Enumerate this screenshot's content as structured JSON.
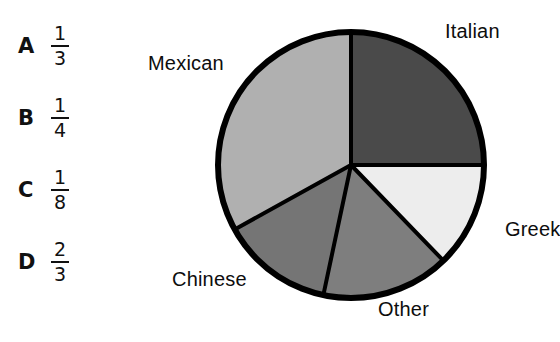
{
  "figure": {
    "name": "favorite-cuisine-pie-chart",
    "background": "#ffffff"
  },
  "answer_choices": [
    {
      "letter": "A",
      "numerator": "1",
      "denominator": "3"
    },
    {
      "letter": "B",
      "numerator": "1",
      "denominator": "4"
    },
    {
      "letter": "C",
      "numerator": "1",
      "denominator": "8"
    },
    {
      "letter": "D",
      "numerator": "2",
      "denominator": "3"
    }
  ],
  "labels": {
    "mexican": "Mexican",
    "italian": "Italian",
    "greek": "Greek",
    "other": "Other",
    "chinese": "Chinese"
  },
  "chart_data": {
    "type": "pie",
    "title": "",
    "xlabel": "",
    "ylabel": "",
    "legend_position": "outside-labels",
    "grid": false,
    "start_angle_deg": 0,
    "direction": "clockwise",
    "center": {
      "cx": 151,
      "cy": 165,
      "r": 133
    },
    "outline_color": "#000000",
    "outline_width": 6,
    "separator_color": "#000000",
    "separator_width": 4,
    "categories": [
      "Italian",
      "Greek",
      "Other",
      "Chinese",
      "Mexican"
    ],
    "values": [
      25,
      12.8,
      15.6,
      13.6,
      33
    ],
    "units": "percent",
    "slices": [
      {
        "label": "Italian",
        "start_deg": 0,
        "end_deg": 90,
        "sweep_deg": 90,
        "fraction": "1/4",
        "percent": 25,
        "color": "#4a4a4a"
      },
      {
        "label": "Greek",
        "start_deg": 90,
        "end_deg": 136,
        "sweep_deg": 46,
        "fraction": "1/8",
        "percent": 12.8,
        "color": "#ededed"
      },
      {
        "label": "Other",
        "start_deg": 136,
        "end_deg": 192,
        "sweep_deg": 56,
        "fraction": "1/6",
        "percent": 15.6,
        "color": "#7e7e7e"
      },
      {
        "label": "Chinese",
        "start_deg": 192,
        "end_deg": 241,
        "sweep_deg": 49,
        "fraction": "1/7",
        "percent": 13.6,
        "color": "#757575"
      },
      {
        "label": "Mexican",
        "start_deg": 241,
        "end_deg": 360,
        "sweep_deg": 119,
        "fraction": "1/3",
        "percent": 33,
        "color": "#b0b0b0"
      }
    ]
  }
}
